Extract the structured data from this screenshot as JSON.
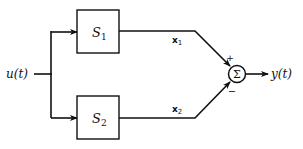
{
  "diagram": {
    "input_label": "u(t)",
    "output_label": "y(t)",
    "blocks": [
      {
        "name": "S",
        "sub": "1"
      },
      {
        "name": "S",
        "sub": "2"
      }
    ],
    "signals": [
      {
        "name": "x",
        "sub": "1"
      },
      {
        "name": "x",
        "sub": "2"
      }
    ],
    "summer": {
      "symbol": "Σ",
      "top_sign": "+",
      "bottom_sign": "−"
    }
  }
}
